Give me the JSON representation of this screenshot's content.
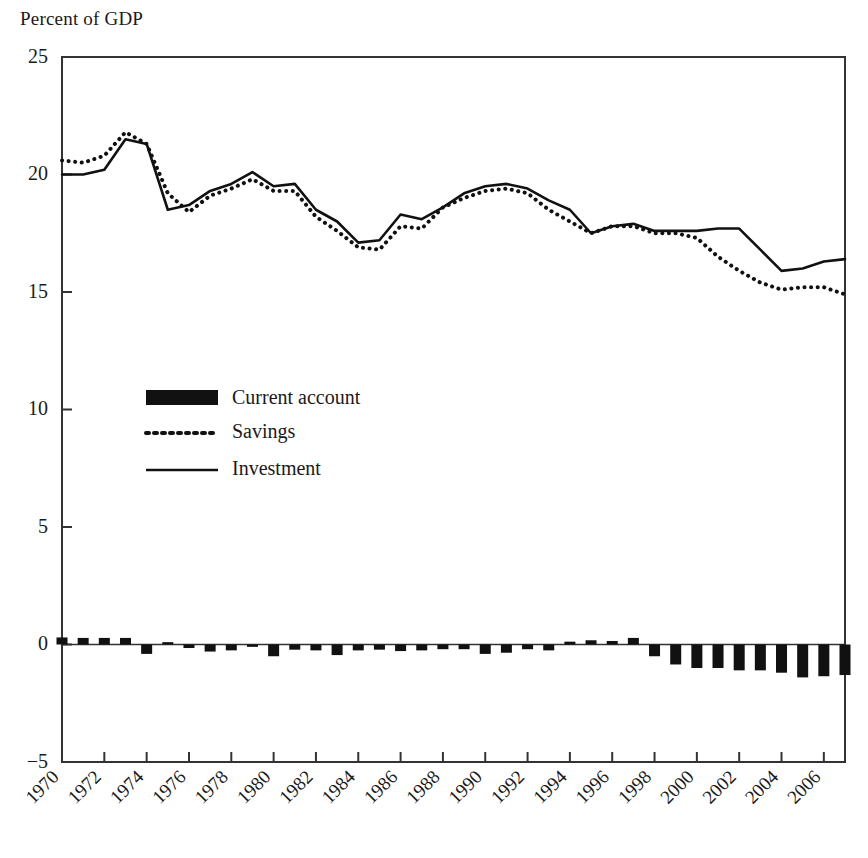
{
  "axis_title": "Percent of GDP",
  "legend": {
    "items": [
      {
        "label": "Current account",
        "style": "bar",
        "color": "#111111"
      },
      {
        "label": "Savings",
        "style": "dotted",
        "color": "#111111"
      },
      {
        "label": "Investment",
        "style": "solid",
        "color": "#111111"
      }
    ]
  },
  "chart_data": {
    "type": "line",
    "title": "",
    "subtitle": "",
    "xlabel": "",
    "ylabel": "Percent of GDP",
    "ylim": [
      -5,
      25
    ],
    "xlim": [
      1970,
      2007
    ],
    "yticks": [
      -5,
      0,
      5,
      10,
      15,
      20,
      25
    ],
    "ytick_labels": [
      "−5",
      "0",
      "5",
      "10",
      "15",
      "20",
      "25"
    ],
    "xticks": [
      1970,
      1972,
      1974,
      1976,
      1978,
      1980,
      1982,
      1984,
      1986,
      1988,
      1990,
      1992,
      1994,
      1996,
      1998,
      2000,
      2002,
      2004,
      2006
    ],
    "xtick_labels": [
      "1970",
      "1972",
      "1974",
      "1976",
      "1978",
      "1980",
      "1982",
      "1984",
      "1986",
      "1988",
      "1990",
      "1992",
      "1994",
      "1996",
      "1998",
      "2000",
      "2002",
      "2004",
      "2006"
    ],
    "grid": false,
    "legend_position": "center-left",
    "x": [
      1970,
      1971,
      1972,
      1973,
      1974,
      1975,
      1976,
      1977,
      1978,
      1979,
      1980,
      1981,
      1982,
      1983,
      1984,
      1985,
      1986,
      1987,
      1988,
      1989,
      1990,
      1991,
      1992,
      1993,
      1994,
      1995,
      1996,
      1997,
      1998,
      1999,
      2000,
      2001,
      2002,
      2003,
      2004,
      2005,
      2006,
      2007
    ],
    "series": [
      {
        "name": "Savings",
        "style": "dotted",
        "color": "#111111",
        "values": [
          20.6,
          20.5,
          20.8,
          21.8,
          21.3,
          19.2,
          18.4,
          19.1,
          19.4,
          19.8,
          19.3,
          19.3,
          18.2,
          17.6,
          16.9,
          16.8,
          17.8,
          17.7,
          18.6,
          19.0,
          19.3,
          19.4,
          19.2,
          18.5,
          18.0,
          17.5,
          17.8,
          17.8,
          17.5,
          17.5,
          17.3,
          16.5,
          15.9,
          15.4,
          15.1,
          15.2,
          15.2,
          14.9
        ]
      },
      {
        "name": "Investment",
        "style": "solid",
        "color": "#111111",
        "values": [
          20.0,
          20.0,
          20.2,
          21.5,
          21.3,
          18.5,
          18.7,
          19.3,
          19.6,
          20.1,
          19.5,
          19.6,
          18.5,
          18.0,
          17.1,
          17.2,
          18.3,
          18.1,
          18.6,
          19.2,
          19.5,
          19.6,
          19.4,
          18.9,
          18.5,
          17.5,
          17.8,
          17.9,
          17.6,
          17.6,
          17.6,
          17.7,
          17.7,
          16.8,
          15.9,
          16.0,
          16.3,
          16.4
        ]
      }
    ],
    "bars": {
      "name": "Current account",
      "color": "#111111",
      "values": [
        0.3,
        0.28,
        0.28,
        0.28,
        -0.4,
        0.1,
        -0.15,
        -0.3,
        -0.25,
        -0.1,
        -0.5,
        -0.22,
        -0.25,
        -0.45,
        -0.25,
        -0.22,
        -0.28,
        -0.25,
        -0.2,
        -0.2,
        -0.4,
        -0.35,
        -0.2,
        -0.25,
        0.12,
        0.18,
        0.15,
        0.28,
        -0.5,
        -0.85,
        -1.0,
        -1.0,
        -1.1,
        -1.1,
        -1.2,
        -1.4,
        -1.35,
        -1.3
      ]
    }
  }
}
